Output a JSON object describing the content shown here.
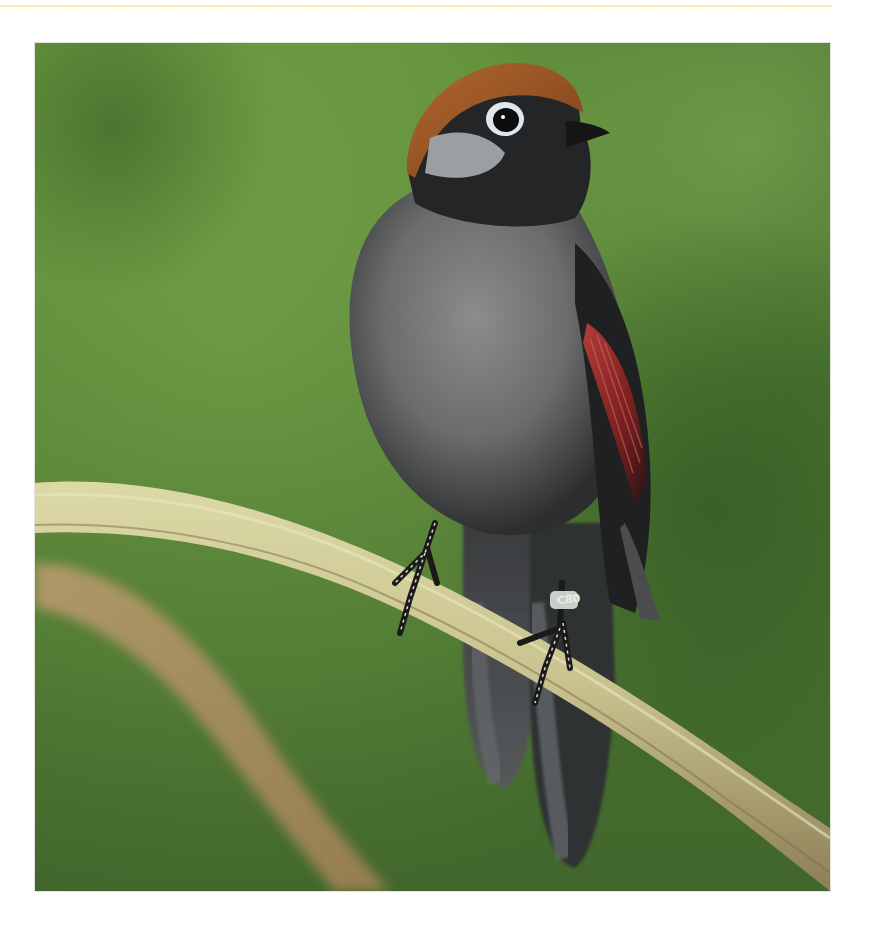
{
  "page": {
    "background": "#ffffff",
    "top_rule_color": "#f4e79a"
  },
  "photo": {
    "subject": "bird perched on branch",
    "description": "Grey-bodied bird with rufous-brown crown, white eye-ring, black face and throat, red-chestnut wing panel, long dark tail, perched on a curved pale green-tan stem; second blurred stem crosses lower left; blurred green foliage background",
    "colors": {
      "background_green": "#6d9a43",
      "background_dark": "#3f6a2a",
      "crown_rufous": "#9a5526",
      "body_grey": "#6e7072",
      "face_black": "#1e2020",
      "wing_red": "#9c2b2b",
      "branch_tan": "#c9c594",
      "branch_blur": "#a88a5a"
    },
    "leg_band_text": "C80"
  }
}
